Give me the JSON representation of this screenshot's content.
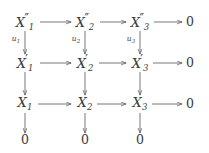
{
  "diagram": {
    "kind": "commutative-diagram",
    "background_color": "#ffffff",
    "ink_color": "#3a3a3a",
    "arrow_color": "#555555",
    "columns_x": [
      25,
      85,
      140,
      190
    ],
    "rows_y": [
      22,
      63,
      104,
      140
    ],
    "nodes": [
      {
        "id": "r1c1",
        "base": "X",
        "prime": "″",
        "sub": "1",
        "col": 0,
        "row": 0,
        "is_zero": false
      },
      {
        "id": "r1c2",
        "base": "X",
        "prime": "″",
        "sub": "2",
        "col": 1,
        "row": 0,
        "is_zero": false
      },
      {
        "id": "r1c3",
        "base": "X",
        "prime": "″",
        "sub": "3",
        "col": 2,
        "row": 0,
        "is_zero": false
      },
      {
        "id": "r1c4",
        "base": "0",
        "prime": "",
        "sub": "",
        "col": 3,
        "row": 0,
        "is_zero": true
      },
      {
        "id": "r2c1",
        "base": "X",
        "prime": "′",
        "sub": "1",
        "col": 0,
        "row": 1,
        "is_zero": false
      },
      {
        "id": "r2c2",
        "base": "X",
        "prime": "′",
        "sub": "2",
        "col": 1,
        "row": 1,
        "is_zero": false
      },
      {
        "id": "r2c3",
        "base": "X",
        "prime": "′",
        "sub": "3",
        "col": 2,
        "row": 1,
        "is_zero": false
      },
      {
        "id": "r2c4",
        "base": "0",
        "prime": "",
        "sub": "",
        "col": 3,
        "row": 1,
        "is_zero": true
      },
      {
        "id": "r3c1",
        "base": "X",
        "prime": "",
        "sub": "1",
        "col": 0,
        "row": 2,
        "is_zero": false
      },
      {
        "id": "r3c2",
        "base": "X",
        "prime": "",
        "sub": "2",
        "col": 1,
        "row": 2,
        "is_zero": false
      },
      {
        "id": "r3c3",
        "base": "X",
        "prime": "",
        "sub": "3",
        "col": 2,
        "row": 2,
        "is_zero": false
      },
      {
        "id": "r3c4",
        "base": "0",
        "prime": "",
        "sub": "",
        "col": 3,
        "row": 2,
        "is_zero": true
      },
      {
        "id": "r4c1",
        "base": "0",
        "prime": "",
        "sub": "",
        "col": 0,
        "row": 3,
        "is_zero": true
      },
      {
        "id": "r4c2",
        "base": "0",
        "prime": "",
        "sub": "",
        "col": 1,
        "row": 3,
        "is_zero": true
      },
      {
        "id": "r4c3",
        "base": "0",
        "prime": "",
        "sub": "",
        "col": 2,
        "row": 3,
        "is_zero": true
      }
    ],
    "vertical_labels": [
      {
        "id": "u1",
        "base": "u",
        "sub": "1",
        "x": 16,
        "y": 40
      },
      {
        "id": "u2",
        "base": "u",
        "sub": "2",
        "x": 76,
        "y": 40
      },
      {
        "id": "u3",
        "base": "u",
        "sub": "3",
        "x": 131,
        "y": 40
      }
    ]
  }
}
